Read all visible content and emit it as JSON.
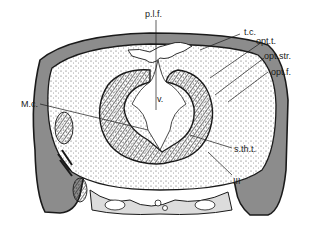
{
  "figure": {
    "type": "anatomical cross-section diagram",
    "colors": {
      "background": "#ffffff",
      "ink": "#1a1a1a",
      "wall_fill": "#8c8c8c",
      "stipple_dot": "#333333"
    },
    "labels": {
      "plf": "p.l.f.",
      "tc": "t.c.",
      "optt": "opt.t.",
      "optstr": "opt.str.",
      "optf": "opt.f.",
      "mc": "M.c.",
      "v": "v.",
      "stht": "s.th.t.",
      "iii": "III"
    }
  }
}
